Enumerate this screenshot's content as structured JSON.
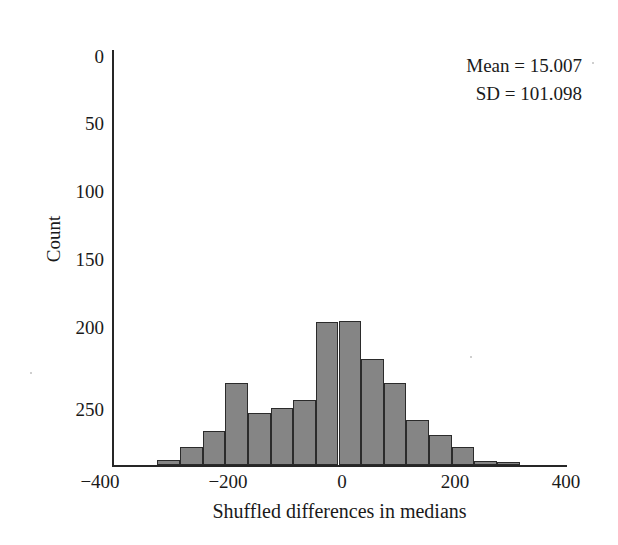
{
  "figure": {
    "background_color": "#ffffff",
    "bar_fill_color": "#858585",
    "bar_edge_color": "#2b2b2b",
    "axis_color": "#262626"
  },
  "annotation": {
    "mean_line": "Mean = 15.007",
    "sd_line": "SD = 101.098"
  },
  "axes": {
    "xlabel": "Shuffled differences in medians",
    "ylabel": "Count",
    "xticks": [
      "−400",
      "−200",
      "0",
      "200",
      "400"
    ],
    "yticks": [
      "0",
      "50",
      "100",
      "150",
      "200",
      "250"
    ]
  },
  "chart_data": {
    "type": "bar",
    "title": "",
    "subtitle": "",
    "xlabel": "Shuffled differences in medians",
    "ylabel": "Count",
    "xlim": [
      -400,
      400
    ],
    "ylim": [
      0,
      305
    ],
    "y_axis_inverted": true,
    "grid": false,
    "legend": null,
    "bin_width": 40,
    "x_tick_values": [
      -400,
      -200,
      0,
      200,
      400
    ],
    "x_tick_labels": [
      "−400",
      "−200",
      "0",
      "200",
      "400"
    ],
    "y_tick_values": [
      0,
      50,
      100,
      150,
      200,
      250
    ],
    "y_tick_labels": [
      "0",
      "50",
      "100",
      "150",
      "200",
      "250"
    ],
    "bin_edges": [
      -320,
      -280,
      -240,
      -200,
      -160,
      -120,
      -80,
      -40,
      0,
      40,
      80,
      120,
      160,
      200,
      240,
      280,
      320
    ],
    "bin_centers": [
      -300,
      -260,
      -220,
      -180,
      -140,
      -100,
      -60,
      -20,
      20,
      60,
      100,
      140,
      180,
      220,
      260,
      300
    ],
    "values": [
      4,
      13,
      25,
      60,
      38,
      42,
      48,
      105,
      106,
      78,
      60,
      33,
      22,
      13,
      3,
      2
    ],
    "annotations": [
      "Mean = 15.007",
      "SD = 101.098"
    ],
    "statistics": {
      "mean": 15.007,
      "sd": 101.098
    }
  }
}
